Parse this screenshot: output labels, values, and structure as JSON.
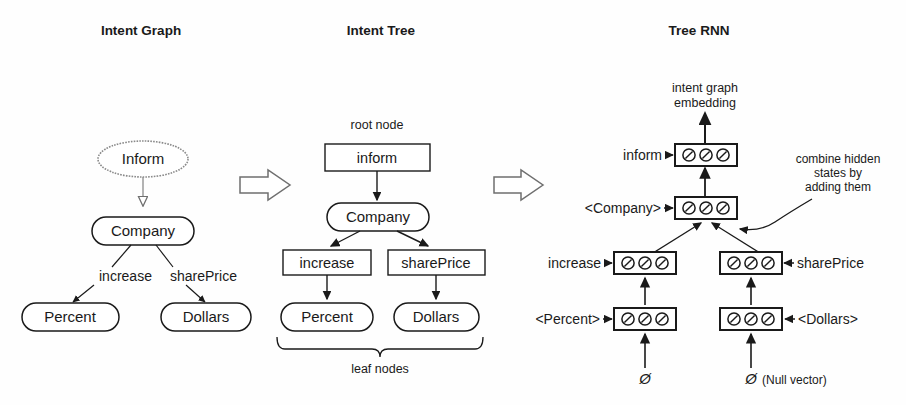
{
  "panels": {
    "left": {
      "title": "Intent Graph"
    },
    "middle": {
      "title": "Intent Tree"
    },
    "right": {
      "title": "Tree RNN"
    }
  },
  "intent_graph": {
    "root": "Inform",
    "child": "Company",
    "edge_labels": {
      "left": "increase",
      "right": "sharePrice"
    },
    "leaves": {
      "left": "Percent",
      "right": "Dollars"
    }
  },
  "intent_tree": {
    "root_caption": "root node",
    "root": "inform",
    "child": "Company",
    "slots": {
      "left": "increase",
      "right": "sharePrice"
    },
    "leaves": {
      "left": "Percent",
      "right": "Dollars"
    },
    "leaf_caption": "leaf nodes"
  },
  "tree_rnn": {
    "output_label_line1": "intent graph",
    "output_label_line2": "embedding",
    "cells": [
      {
        "id": "inform",
        "label": "inform",
        "label_side": "left"
      },
      {
        "id": "company",
        "label": "<Company>",
        "label_side": "left"
      },
      {
        "id": "increase",
        "label": "increase",
        "label_side": "left"
      },
      {
        "id": "shareprice",
        "label": "sharePrice",
        "label_side": "right"
      },
      {
        "id": "percent",
        "label": "<Percent>",
        "label_side": "left"
      },
      {
        "id": "dollars",
        "label": "<Dollars>",
        "label_side": "right"
      }
    ],
    "annotation": {
      "line1": "combine hidden",
      "line2": "states by",
      "line3": "adding them"
    },
    "null_inputs": {
      "left_symbol": "Ø",
      "right_symbol": "Ø",
      "right_caption": "(Null vector)"
    },
    "unit_icon": "slashed-circle-icon"
  },
  "transition_arrows": [
    {
      "id": "graph-to-tree",
      "icon": "right-arrow-icon"
    },
    {
      "id": "tree-to-rnn",
      "icon": "right-arrow-icon"
    }
  ],
  "colors": {
    "ink": "#1a1a1a",
    "gray": "#8a8a8a",
    "background": "#fefefe"
  }
}
